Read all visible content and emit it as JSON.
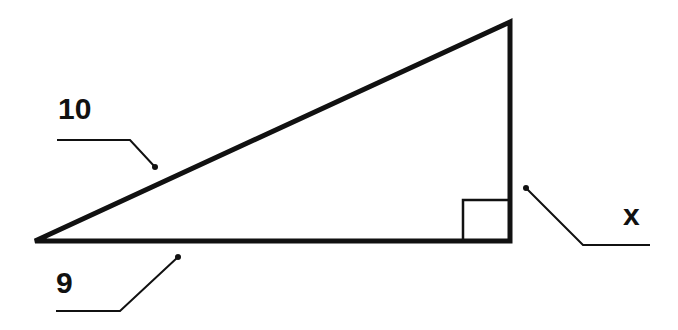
{
  "diagram": {
    "type": "right-triangle",
    "labels": {
      "hypotenuse": "10",
      "base": "9",
      "height": "x"
    },
    "right_angle_marker": true,
    "colors": {
      "stroke": "#111111",
      "background": "#ffffff"
    }
  }
}
